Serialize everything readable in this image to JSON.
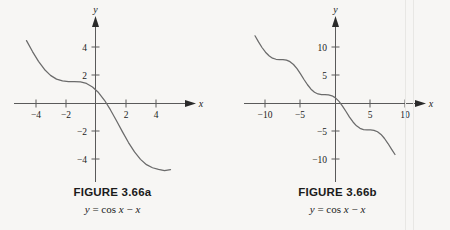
{
  "figures": [
    {
      "id": "figure-a",
      "caption_title": "FIGURE 3.66a",
      "formula": {
        "lhs": "y",
        "eq": "=",
        "fn": "cos",
        "arg": "x",
        "minus": "−",
        "term": "x"
      },
      "axis_labels": {
        "x": "x",
        "y": "y"
      },
      "x_ticks": [
        "−4",
        "−2",
        "2",
        "4"
      ],
      "y_ticks": [
        "4",
        "2",
        "−2",
        "−4"
      ],
      "chart_data": {
        "type": "line",
        "title": "FIGURE 3.66a",
        "expression": "y = cos x - x",
        "xlabel": "x",
        "ylabel": "y",
        "xlim": [
          -5.2,
          5.2
        ],
        "ylim": [
          -5.3,
          5.3
        ],
        "xticks": [
          -4,
          -2,
          2,
          4
        ],
        "yticks": [
          4,
          2,
          -2,
          -4
        ],
        "grid": false,
        "legend": "none",
        "x": [
          -4.6,
          -4.2,
          -3.8,
          -3.4,
          -3.0,
          -2.6,
          -2.2,
          -1.8,
          -1.4,
          -1.0,
          -0.6,
          -0.2,
          0.2,
          0.6,
          1.0,
          1.4,
          1.8,
          2.2,
          2.6,
          3.0,
          3.4,
          3.8,
          4.2,
          4.6,
          5.0
        ],
        "y": [
          4.49,
          3.71,
          3.01,
          2.43,
          2.01,
          1.74,
          1.61,
          1.57,
          1.57,
          1.54,
          1.43,
          1.18,
          0.78,
          0.23,
          -0.46,
          -1.23,
          -2.03,
          -2.79,
          -3.46,
          -3.99,
          -4.37,
          -4.59,
          -4.71,
          -4.79,
          -4.72
        ]
      }
    },
    {
      "id": "figure-b",
      "caption_title": "FIGURE 3.66b",
      "formula": {
        "lhs": "y",
        "eq": "=",
        "fn": "cos",
        "arg": "x",
        "minus": "−",
        "term": "x"
      },
      "axis_labels": {
        "x": "x",
        "y": "y"
      },
      "x_ticks": [
        "−10",
        "−5",
        "5",
        "10"
      ],
      "y_ticks": [
        "10",
        "5",
        "−5",
        "−10"
      ],
      "chart_data": {
        "type": "line",
        "title": "FIGURE 3.66b",
        "expression": "y = cos x - x",
        "xlabel": "x",
        "ylabel": "y",
        "xlim": [
          -13,
          13
        ],
        "ylim": [
          -13.5,
          13.5
        ],
        "xticks": [
          -10,
          -5,
          5,
          10
        ],
        "yticks": [
          10,
          5,
          -5,
          -10
        ],
        "grid": false,
        "legend": "none",
        "x": [
          -11.5,
          -11.0,
          -10.5,
          -10.0,
          -9.5,
          -9.0,
          -8.5,
          -8.0,
          -7.5,
          -7.0,
          -6.5,
          -6.0,
          -5.5,
          -5.0,
          -4.5,
          -4.0,
          -3.5,
          -3.0,
          -2.5,
          -2.0,
          -1.5,
          -1.0,
          -0.5,
          0.0,
          0.5,
          1.0,
          1.5,
          2.0,
          2.5,
          3.0,
          3.5,
          4.0,
          4.5,
          5.0,
          5.5,
          6.0,
          6.5,
          7.0,
          7.5,
          8.0,
          8.5
        ],
        "y": [
          12.09,
          11.0,
          10.0,
          9.16,
          8.53,
          8.09,
          7.9,
          7.85,
          7.85,
          7.75,
          7.47,
          6.96,
          6.21,
          5.28,
          4.29,
          3.35,
          2.56,
          2.01,
          1.7,
          1.58,
          1.57,
          1.54,
          1.38,
          1.0,
          0.38,
          -0.46,
          -1.43,
          -2.42,
          -3.3,
          -3.99,
          -4.44,
          -4.65,
          -4.71,
          -4.72,
          -4.79,
          -5.04,
          -5.52,
          -6.25,
          -7.15,
          -8.15,
          -9.11
        ]
      }
    }
  ]
}
